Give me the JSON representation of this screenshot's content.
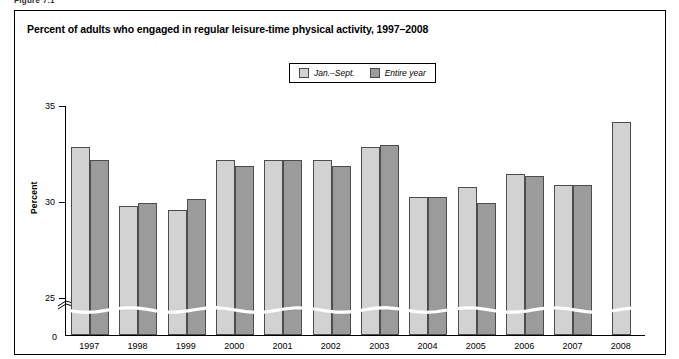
{
  "figure_number": "Figure 7.1",
  "title": "Percent of adults who engaged in regular leisure-time physical activity, 1997–2008",
  "legend": {
    "items": [
      {
        "label": "Jan.–Sept.",
        "color": "#d2d2d2",
        "icon": "legend-swatch-light"
      },
      {
        "label": "Entire year",
        "color": "#9b9b9b",
        "icon": "legend-swatch-dark"
      }
    ]
  },
  "axis": {
    "ylabel": "Percent",
    "yticks": [
      "35",
      "30",
      "25"
    ],
    "zero_label": "0",
    "axis_break": "y-axis-break"
  },
  "chart_data": {
    "type": "bar",
    "title": "Percent of adults who engaged in regular leisure-time physical activity, 1997–2008",
    "xlabel": "",
    "ylabel": "Percent",
    "ylim": [
      23,
      35
    ],
    "ytick_values": [
      25,
      30,
      35
    ],
    "grid": false,
    "legend_position": "top-center",
    "axis_break": true,
    "categories": [
      "1997",
      "1998",
      "1999",
      "2000",
      "2001",
      "2002",
      "2003",
      "2004",
      "2005",
      "2006",
      "2007",
      "2008"
    ],
    "series": [
      {
        "name": "Jan.–Sept.",
        "color": "#d2d2d2",
        "values": [
          32.8,
          29.7,
          29.5,
          32.1,
          32.1,
          32.1,
          32.8,
          30.2,
          30.7,
          31.4,
          30.8,
          34.1
        ]
      },
      {
        "name": "Entire year",
        "color": "#9b9b9b",
        "values": [
          32.1,
          29.9,
          30.1,
          31.8,
          32.1,
          31.8,
          32.9,
          30.2,
          29.9,
          31.3,
          30.8,
          null
        ]
      }
    ]
  }
}
